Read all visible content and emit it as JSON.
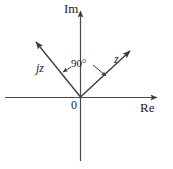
{
  "figure": {
    "background_color": "#ffffff",
    "stroke_color": "#3a3a3a",
    "text_color": "#1a1a1a"
  },
  "axes": {
    "imaginary_label": "Im",
    "real_label": "Re",
    "origin_label": "0",
    "origin": {
      "x": 80,
      "y": 97
    },
    "real_axis": {
      "x1": 5,
      "y1": 97,
      "x2": 160,
      "y2": 97
    },
    "imaginary_axis": {
      "x1": 80,
      "y1": 160,
      "x2": 80,
      "y2": 8
    }
  },
  "vectors": [
    {
      "name": "z",
      "label": "z",
      "from": {
        "x": 80,
        "y": 97
      },
      "to": {
        "x": 133,
        "y": 48
      },
      "angle_deg": 43
    },
    {
      "name": "jz",
      "label": "jz",
      "from": {
        "x": 80,
        "y": 97
      },
      "to": {
        "x": 33,
        "y": 39
      },
      "angle_deg": 133
    }
  ],
  "annotation": {
    "angle_label": "90°",
    "description": "Angle between z and jz"
  }
}
